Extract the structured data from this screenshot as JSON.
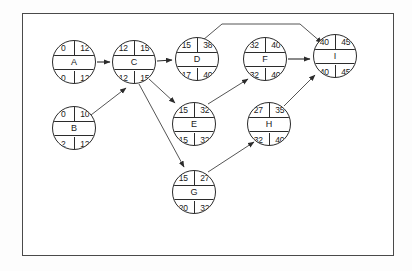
{
  "diagram": {
    "type": "activity-network",
    "title": "",
    "frame": {
      "border_color": "#4a4a4a",
      "background": "#ffffff"
    },
    "node_columns": {
      "earliest_start": "ES",
      "earliest_finish": "EF",
      "latest_start": "LS",
      "latest_finish": "LF"
    },
    "nodes": [
      {
        "id": "A",
        "label": "A",
        "es": "0",
        "ef": "12",
        "ls": "0",
        "lf": "12",
        "x": 52,
        "y": 40
      },
      {
        "id": "B",
        "label": "B",
        "es": "0",
        "ef": "10",
        "ls": "2",
        "lf": "12",
        "x": 52,
        "y": 106
      },
      {
        "id": "C",
        "label": "C",
        "es": "12",
        "ef": "15",
        "ls": "12",
        "lf": "15",
        "x": 112,
        "y": 40
      },
      {
        "id": "D",
        "label": "D",
        "es": "15",
        "ef": "38",
        "ls": "17",
        "lf": "40",
        "x": 175,
        "y": 37
      },
      {
        "id": "E",
        "label": "E",
        "es": "15",
        "ef": "32",
        "ls": "15",
        "lf": "32",
        "x": 172,
        "y": 102
      },
      {
        "id": "F",
        "label": "F",
        "es": "32",
        "ef": "40",
        "ls": "32",
        "lf": "40",
        "x": 243,
        "y": 37
      },
      {
        "id": "G",
        "label": "G",
        "es": "15",
        "ef": "27",
        "ls": "20",
        "lf": "32",
        "x": 172,
        "y": 170
      },
      {
        "id": "H",
        "label": "H",
        "es": "27",
        "ef": "35",
        "ls": "32",
        "lf": "40",
        "x": 247,
        "y": 102
      },
      {
        "id": "I",
        "label": "I",
        "es": "40",
        "ef": "45",
        "ls": "40",
        "lf": "45",
        "x": 313,
        "y": 34
      }
    ],
    "edges": [
      {
        "from": "A",
        "to": "C"
      },
      {
        "from": "B",
        "to": "C"
      },
      {
        "from": "C",
        "to": "D"
      },
      {
        "from": "C",
        "to": "E"
      },
      {
        "from": "C",
        "to": "G"
      },
      {
        "from": "D",
        "to": "I"
      },
      {
        "from": "E",
        "to": "F"
      },
      {
        "from": "G",
        "to": "H"
      },
      {
        "from": "F",
        "to": "I"
      },
      {
        "from": "H",
        "to": "I"
      }
    ]
  }
}
